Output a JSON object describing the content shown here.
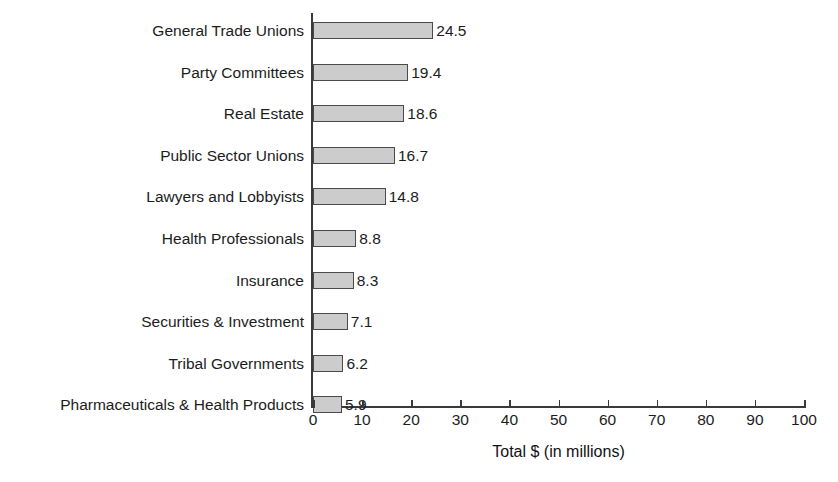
{
  "chart_data": {
    "type": "bar",
    "orientation": "horizontal",
    "title": "",
    "xlabel": "Total $ (in millions)",
    "ylabel": "",
    "xlim": [
      0,
      100
    ],
    "xticks": [
      0,
      10,
      20,
      30,
      40,
      50,
      60,
      70,
      80,
      90,
      100
    ],
    "xtick_labels": [
      "0",
      "10",
      "20",
      "30",
      "40",
      "50",
      "60",
      "70",
      "80",
      "90",
      "100"
    ],
    "grid": false,
    "legend": null,
    "categories": [
      "General Trade Unions",
      "Party Committees",
      "Real Estate",
      "Public Sector Unions",
      "Lawyers and Lobbyists",
      "Health Professionals",
      "Insurance",
      "Securities & Investment",
      "Tribal Governments",
      "Pharmaceuticals & Health Products"
    ],
    "values": [
      24.5,
      19.4,
      18.6,
      16.7,
      14.8,
      8.8,
      8.3,
      7.1,
      6.2,
      5.9
    ],
    "value_labels": [
      "24.5",
      "19.4",
      "18.6",
      "16.7",
      "14.8",
      "8.8",
      "8.3",
      "7.1",
      "6.2",
      "5.9"
    ],
    "bar_fill_color": "#cccccc",
    "bar_edge_color": "#4a4a4a",
    "axis_color": "#3a3a3a",
    "text_color": "#1c1c1c",
    "background_color": "#ffffff"
  }
}
